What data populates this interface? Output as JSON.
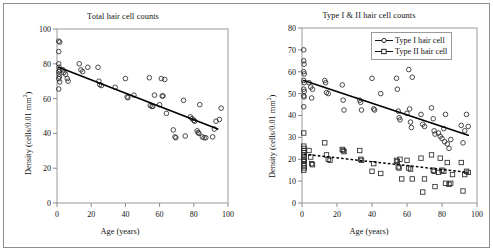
{
  "figure": {
    "panels": [
      {
        "id": "total",
        "title": "Total hair cell counts",
        "xlabel": "Age (years)",
        "ylabel_pre": "Density (cells/0.01 mm",
        "ylabel_sup": "2",
        "ylabel_post": ")"
      },
      {
        "id": "type1and2",
        "title": "Type I & II hair cell counts",
        "xlabel": "Age (years)",
        "ylabel_pre": "Density (cells/0.01 mm",
        "ylabel_sup": "2",
        "ylabel_post": ")"
      }
    ],
    "legend": {
      "items": [
        {
          "label": "Type I hair cell",
          "marker": "circle-icon",
          "line": "solid"
        },
        {
          "label": "Type II hair cell",
          "marker": "square-icon",
          "line": "dashed"
        }
      ]
    }
  },
  "chart_data": [
    {
      "type": "scatter",
      "title": "Total hair cell counts",
      "xlabel": "Age (years)",
      "ylabel": "Density (cells/0.01 mm^2)",
      "xlim": [
        0,
        100
      ],
      "ylim": [
        0,
        100
      ],
      "xticks": [
        0,
        20,
        40,
        60,
        80,
        100
      ],
      "yticks": [
        0,
        20,
        40,
        60,
        80,
        100
      ],
      "grid": false,
      "legend": "none",
      "series": [
        {
          "name": "Total hair cell",
          "marker": "open-circle",
          "points": [
            [
              1,
              93
            ],
            [
              1.6,
              92.5
            ],
            [
              1,
              87
            ],
            [
              1,
              80
            ],
            [
              1.2,
              78
            ],
            [
              1.5,
              76.5
            ],
            [
              1,
              75.5
            ],
            [
              1.2,
              74
            ],
            [
              1.4,
              72.5
            ],
            [
              1,
              71.5
            ],
            [
              1.6,
              69.5
            ],
            [
              1,
              65.5
            ],
            [
              3.5,
              76.5
            ],
            [
              4,
              75
            ],
            [
              5,
              74
            ],
            [
              6,
              71.5
            ],
            [
              6.5,
              70
            ],
            [
              13,
              80
            ],
            [
              14,
              76.5
            ],
            [
              15,
              75.5
            ],
            [
              18,
              78
            ],
            [
              24,
              78
            ],
            [
              24.5,
              70
            ],
            [
              25,
              68
            ],
            [
              26,
              67.5
            ],
            [
              34,
              66.5
            ],
            [
              40,
              71.5
            ],
            [
              41,
              61
            ],
            [
              41.5,
              60.5
            ],
            [
              45,
              62
            ],
            [
              54,
              72
            ],
            [
              54.5,
              56
            ],
            [
              55.5,
              55.5
            ],
            [
              56,
              55.5
            ],
            [
              57,
              62
            ],
            [
              60,
              56.5
            ],
            [
              61,
              71.5
            ],
            [
              61.5,
              61.5
            ],
            [
              62,
              61.5
            ],
            [
              63,
              71
            ],
            [
              64,
              51.5
            ],
            [
              68,
              42
            ],
            [
              69,
              38
            ],
            [
              69.5,
              37.5
            ],
            [
              74,
              59
            ],
            [
              75,
              38.5
            ],
            [
              78,
              49.5
            ],
            [
              79,
              48.5
            ],
            [
              80,
              47.5
            ],
            [
              80.5,
              47
            ],
            [
              82,
              41.5
            ],
            [
              82.5,
              40.5
            ],
            [
              83,
              40
            ],
            [
              83.5,
              56.5
            ],
            [
              85,
              38
            ],
            [
              86,
              37.5
            ],
            [
              87,
              37.5
            ],
            [
              91,
              38
            ],
            [
              92,
              42.5
            ],
            [
              93,
              47
            ],
            [
              95,
              48
            ],
            [
              96,
              54.5
            ]
          ]
        }
      ],
      "fits": [
        {
          "name": "Total hair cell regression",
          "style": "solid",
          "x": [
            1,
            94
          ],
          "y": [
            78,
            42.5
          ]
        }
      ]
    },
    {
      "type": "scatter",
      "title": "Type I & II hair cell counts",
      "xlabel": "Age (years)",
      "ylabel": "Density (cells/0.01 mm^2)",
      "xlim": [
        0,
        100
      ],
      "ylim": [
        0,
        80
      ],
      "xticks": [
        0,
        20,
        40,
        60,
        80,
        100
      ],
      "yticks": [
        0,
        10,
        20,
        30,
        40,
        50,
        60,
        70,
        80
      ],
      "grid": false,
      "legend": "upper-right",
      "series": [
        {
          "name": "Type I hair cell",
          "marker": "open-circle",
          "points": [
            [
              1,
              70
            ],
            [
              1,
              65
            ],
            [
              1.2,
              63.5
            ],
            [
              1,
              60
            ],
            [
              1.3,
              59
            ],
            [
              1,
              56
            ],
            [
              1.2,
              55
            ],
            [
              1,
              52
            ],
            [
              1.3,
              51
            ],
            [
              1,
              49
            ],
            [
              1.2,
              48.5
            ],
            [
              1,
              44
            ],
            [
              4,
              55
            ],
            [
              5,
              53
            ],
            [
              5.5,
              48
            ],
            [
              6,
              52
            ],
            [
              13,
              56
            ],
            [
              13.5,
              55
            ],
            [
              14,
              50.5
            ],
            [
              15,
              50
            ],
            [
              23,
              54
            ],
            [
              23.5,
              47
            ],
            [
              24,
              42.5
            ],
            [
              33,
              47
            ],
            [
              33.5,
              46
            ],
            [
              34,
              42.5
            ],
            [
              40,
              57
            ],
            [
              41,
              43
            ],
            [
              41.5,
              42.5
            ],
            [
              45,
              50
            ],
            [
              54,
              57
            ],
            [
              54.5,
              52
            ],
            [
              55,
              42
            ],
            [
              55.5,
              39
            ],
            [
              56,
              38
            ],
            [
              60,
              41
            ],
            [
              61,
              61
            ],
            [
              61.5,
              43
            ],
            [
              62,
              37
            ],
            [
              62.5,
              34.5
            ],
            [
              63,
              57.5
            ],
            [
              68,
              40.5
            ],
            [
              69,
              36
            ],
            [
              70,
              35
            ],
            [
              74,
              43.5
            ],
            [
              75,
              38.5
            ],
            [
              75.5,
              33
            ],
            [
              76,
              31.5
            ],
            [
              78,
              32
            ],
            [
              79,
              30.5
            ],
            [
              80,
              29.5
            ],
            [
              81,
              34
            ],
            [
              81.5,
              28
            ],
            [
              82,
              40.5
            ],
            [
              83,
              27
            ],
            [
              84,
              25
            ],
            [
              85,
              29
            ],
            [
              91,
              35.5
            ],
            [
              92,
              27.5
            ],
            [
              93,
              33
            ],
            [
              94,
              40.5
            ],
            [
              95,
              35
            ]
          ]
        },
        {
          "name": "Type II hair cell",
          "marker": "open-square",
          "points": [
            [
              1,
              32
            ],
            [
              1,
              26
            ],
            [
              1.2,
              25
            ],
            [
              1,
              24
            ],
            [
              1.3,
              23
            ],
            [
              1,
              22
            ],
            [
              1.2,
              21
            ],
            [
              1,
              20
            ],
            [
              1.3,
              19.5
            ],
            [
              1,
              19
            ],
            [
              1.2,
              18
            ],
            [
              1,
              17
            ],
            [
              1.3,
              16
            ],
            [
              1,
              15
            ],
            [
              4,
              24
            ],
            [
              5,
              21
            ],
            [
              5.5,
              18
            ],
            [
              6,
              17.5
            ],
            [
              13,
              27.5
            ],
            [
              14,
              22
            ],
            [
              15,
              20
            ],
            [
              16,
              19.5
            ],
            [
              23,
              24.5
            ],
            [
              23.5,
              24
            ],
            [
              24,
              23.5
            ],
            [
              33,
              24
            ],
            [
              33.5,
              20
            ],
            [
              34,
              19.5
            ],
            [
              40,
              14.5
            ],
            [
              41,
              18
            ],
            [
              45,
              13.5
            ],
            [
              54,
              19.5
            ],
            [
              54.5,
              19
            ],
            [
              55,
              16.5
            ],
            [
              55.5,
              16
            ],
            [
              56,
              20
            ],
            [
              57,
              11
            ],
            [
              60,
              19.5
            ],
            [
              61,
              16
            ],
            [
              62,
              15.5
            ],
            [
              63,
              11
            ],
            [
              68,
              20.5
            ],
            [
              69,
              5
            ],
            [
              70,
              11
            ],
            [
              74,
              22
            ],
            [
              75,
              15
            ],
            [
              75.5,
              14.5
            ],
            [
              76,
              7.5
            ],
            [
              78,
              14
            ],
            [
              79,
              20.5
            ],
            [
              80,
              15
            ],
            [
              81,
              14.5
            ],
            [
              82,
              9
            ],
            [
              83,
              18.5
            ],
            [
              84,
              8.5
            ],
            [
              85,
              9
            ],
            [
              86,
              13
            ],
            [
              91,
              18.5
            ],
            [
              92,
              5.5
            ],
            [
              93,
              13
            ],
            [
              94,
              14.5
            ],
            [
              95,
              14
            ]
          ]
        }
      ],
      "fits": [
        {
          "name": "Type I hair cell regression",
          "style": "solid",
          "x": [
            1,
            95
          ],
          "y": [
            56,
            31
          ]
        },
        {
          "name": "Type II hair cell regression",
          "style": "dashed",
          "x": [
            1,
            95
          ],
          "y": [
            22.3,
            14
          ]
        }
      ]
    }
  ]
}
